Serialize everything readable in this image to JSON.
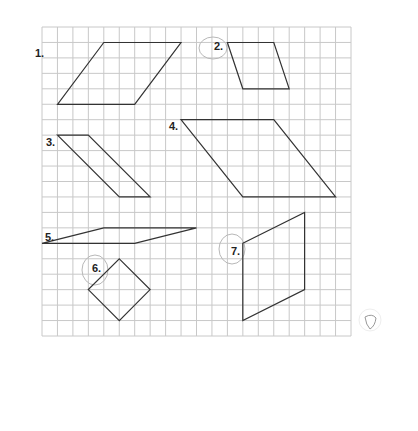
{
  "worksheet": {
    "grid": {
      "origin_x": 42,
      "origin_y": 27,
      "cell": 15.45,
      "cols": 20,
      "rows": 20,
      "line_color": "#c8c8c8",
      "stroke_color": "#333333"
    },
    "shapes": [
      {
        "label": "1.",
        "points": [
          [
            4,
            1
          ],
          [
            9,
            1
          ],
          [
            6,
            5
          ],
          [
            1,
            5
          ]
        ],
        "label_pos": [
          35,
          57
        ]
      },
      {
        "label": "2.",
        "points": [
          [
            12,
            1
          ],
          [
            15,
            1
          ],
          [
            16,
            4
          ],
          [
            13,
            4
          ]
        ],
        "label_pos": [
          214,
          50
        ]
      },
      {
        "label": "3.",
        "points": [
          [
            1,
            7
          ],
          [
            3,
            7
          ],
          [
            7,
            11
          ],
          [
            5,
            11
          ]
        ],
        "label_pos": [
          46,
          146
        ]
      },
      {
        "label": "4.",
        "points": [
          [
            9,
            6
          ],
          [
            15,
            6
          ],
          [
            19,
            11
          ],
          [
            13,
            11
          ]
        ],
        "label_pos": [
          169,
          130
        ]
      },
      {
        "label": "5.",
        "points": [
          [
            0,
            14
          ],
          [
            4,
            13
          ],
          [
            10,
            13
          ],
          [
            6,
            14
          ]
        ],
        "label_pos": [
          45,
          241
        ]
      },
      {
        "label": "6.",
        "points": [
          [
            5,
            15
          ],
          [
            7,
            17
          ],
          [
            5,
            19
          ],
          [
            3,
            17
          ]
        ],
        "label_pos": [
          92,
          272
        ]
      },
      {
        "label": "7.",
        "points": [
          [
            13,
            14
          ],
          [
            17,
            12
          ],
          [
            17,
            17
          ],
          [
            13,
            19
          ]
        ],
        "label_pos": [
          231,
          255
        ]
      }
    ],
    "pencil_marks": [
      {
        "type": "circle",
        "around": "2.",
        "cx": 213,
        "cy": 48,
        "rx": 14,
        "ry": 11
      },
      {
        "type": "circle",
        "around": "6.",
        "cx": 95,
        "cy": 270,
        "rx": 13,
        "ry": 15
      },
      {
        "type": "circle",
        "around": "7.",
        "cx": 232,
        "cy": 249,
        "rx": 13,
        "ry": 15
      }
    ]
  }
}
